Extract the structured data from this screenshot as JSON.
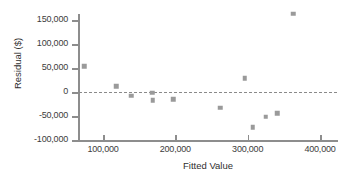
{
  "chart_data": {
    "type": "scatter",
    "title": "",
    "xlabel": "Fitted Value",
    "ylabel": "Residual ($)",
    "xlim": [
      60000,
      420000
    ],
    "ylim": [
      -100000,
      175000
    ],
    "xticks": [
      100000,
      200000,
      300000,
      400000
    ],
    "xticklabels": [
      "100,000",
      "200,000",
      "300,000",
      "400,000"
    ],
    "yticks": [
      -100000,
      -50000,
      0,
      50000,
      100000,
      150000
    ],
    "yticklabels": [
      "-100,000",
      "-50,000",
      "0",
      "50,000",
      "100,000",
      "150,000"
    ],
    "grid": false,
    "legend": null,
    "reference_line": {
      "kind": "horizontal-dashed",
      "y": 0,
      "style": "dashed",
      "color": "#8a8a8a"
    },
    "marker": {
      "shape": "square",
      "color": "#9a9a9a",
      "size": 4.5
    },
    "points": [
      {
        "x": 74000,
        "y": 54000
      },
      {
        "x": 118000,
        "y": 12000
      },
      {
        "x": 139000,
        "y": -8000
      },
      {
        "x": 168000,
        "y": -2000
      },
      {
        "x": 169000,
        "y": -17000
      },
      {
        "x": 197000,
        "y": -15000
      },
      {
        "x": 262000,
        "y": -33000
      },
      {
        "x": 296000,
        "y": 29000
      },
      {
        "x": 307000,
        "y": -73000
      },
      {
        "x": 325000,
        "y": -52000
      },
      {
        "x": 341000,
        "y": -44000
      },
      {
        "x": 363000,
        "y": 163000
      }
    ]
  },
  "colors": {
    "axis": "#8d8d8d",
    "text": "#3c3c3c",
    "marker": "#9a9a9a",
    "reference": "#8a8a8a",
    "background": "#ffffff"
  }
}
